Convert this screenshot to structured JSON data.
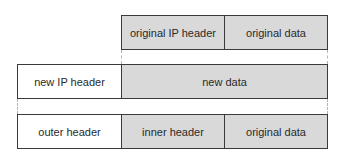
{
  "diagram": {
    "rows": [
      {
        "name": "original-packet",
        "cells": [
          {
            "label": "original IP header",
            "fill": "#d9d9d9"
          },
          {
            "label": "original data",
            "fill": "#d9d9d9"
          }
        ]
      },
      {
        "name": "encapsulated-packet",
        "cells": [
          {
            "label": "new IP header",
            "fill": "#ffffff"
          },
          {
            "label": "new data",
            "fill": "#d9d9d9"
          }
        ]
      },
      {
        "name": "tunneled-packet",
        "cells": [
          {
            "label": "outer header",
            "fill": "#ffffff"
          },
          {
            "label": "inner header",
            "fill": "#d9d9d9"
          },
          {
            "label": "original data",
            "fill": "#d9d9d9"
          }
        ]
      }
    ],
    "colors": {
      "border": "#3a3a3a",
      "shaded": "#d9d9d9",
      "connector": "#b5b5b5"
    }
  }
}
